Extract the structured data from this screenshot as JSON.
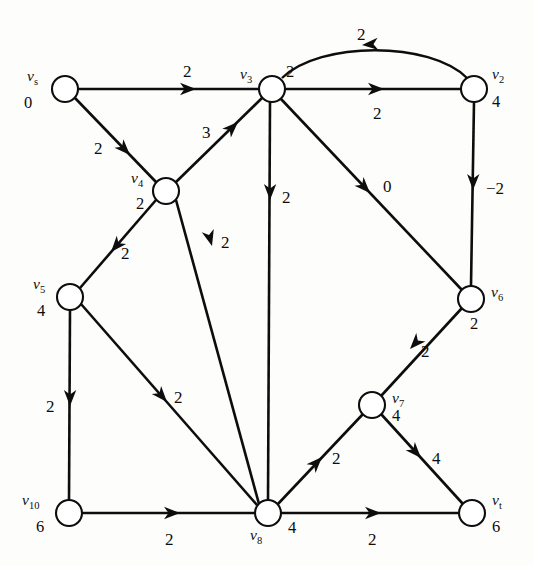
{
  "figure": {
    "kind": "directed-graph-diagram",
    "colors": {
      "ink": "#0d0d0d",
      "node_fill": "#ffffff",
      "background": "#fdfdfc"
    }
  },
  "nodes": [
    {
      "id": "vs",
      "name": "v",
      "sub": "s",
      "value": "0",
      "cx": 65,
      "cy": 89,
      "r": 13,
      "name_x": 27,
      "name_y": 68,
      "value_x": 24,
      "value_y": 95
    },
    {
      "id": "v3",
      "name": "v",
      "sub": "3",
      "value": "2",
      "cx": 272,
      "cy": 89,
      "r": 13,
      "name_x": 240,
      "name_y": 66,
      "value_x": 286,
      "value_y": 64
    },
    {
      "id": "v2",
      "name": "v",
      "sub": "2",
      "value": "4",
      "cx": 474,
      "cy": 89,
      "r": 13,
      "name_x": 492,
      "name_y": 66,
      "value_x": 492,
      "value_y": 94
    },
    {
      "id": "v4",
      "name": "v",
      "sub": "4",
      "value": "2",
      "cx": 166,
      "cy": 191,
      "r": 13,
      "name_x": 131,
      "name_y": 170,
      "value_x": 136,
      "value_y": 196
    },
    {
      "id": "v5",
      "name": "v",
      "sub": "5",
      "value": "4",
      "cx": 70,
      "cy": 297,
      "r": 13,
      "name_x": 33,
      "name_y": 276,
      "value_x": 37,
      "value_y": 303
    },
    {
      "id": "v6",
      "name": "v",
      "sub": "6",
      "value": "2",
      "cx": 471,
      "cy": 299,
      "r": 13,
      "name_x": 491,
      "name_y": 284,
      "value_x": 470,
      "value_y": 316
    },
    {
      "id": "v7",
      "name": "v",
      "sub": "7",
      "value": "4",
      "cx": 372,
      "cy": 405,
      "r": 13,
      "name_x": 392,
      "name_y": 390,
      "value_x": 392,
      "value_y": 408
    },
    {
      "id": "v8",
      "name": "v",
      "sub": "8",
      "value": "4",
      "cx": 268,
      "cy": 513,
      "r": 13,
      "name_x": 250,
      "name_y": 527,
      "value_x": 288,
      "value_y": 520
    },
    {
      "id": "v10",
      "name": "v",
      "sub": "10",
      "value": "6",
      "cx": 69,
      "cy": 513,
      "r": 13,
      "name_x": 22,
      "name_y": 492,
      "value_x": 36,
      "value_y": 519
    },
    {
      "id": "vt",
      "name": "v",
      "sub": "t",
      "value": "6",
      "cx": 472,
      "cy": 513,
      "r": 13,
      "name_x": 492,
      "name_y": 492,
      "value_x": 492,
      "value_y": 519
    }
  ],
  "edges": [
    {
      "id": "vs-v3",
      "from": "vs",
      "to": "v3",
      "weight": "2",
      "shape": "line",
      "x1": 78,
      "y1": 89,
      "x2": 259,
      "y2": 89,
      "ax": 196,
      "ay": 89,
      "lx": 183,
      "ly": 63
    },
    {
      "id": "vs-v4",
      "from": "vs",
      "to": "v4",
      "weight": "2",
      "shape": "line",
      "x1": 75,
      "y1": 98,
      "x2": 156,
      "y2": 182,
      "ax": 130,
      "ay": 155,
      "lx": 94,
      "ly": 140
    },
    {
      "id": "v4-v3",
      "from": "v4",
      "to": "v3",
      "weight": "3",
      "shape": "line",
      "x1": 176,
      "y1": 182,
      "x2": 262,
      "y2": 98,
      "ax": 238,
      "ay": 122,
      "lx": 202,
      "ly": 124
    },
    {
      "id": "v3-v2",
      "from": "v3",
      "to": "v2",
      "weight": "2",
      "shape": "line",
      "x1": 285,
      "y1": 89,
      "x2": 461,
      "y2": 89,
      "ax": 384,
      "ay": 89,
      "lx": 373,
      "ly": 105
    },
    {
      "id": "v2-v3",
      "from": "v2",
      "to": "v3",
      "weight": "2",
      "shape": "curve",
      "path": "M 467 78 C 430 41, 320 41, 282 78",
      "ax": 362,
      "ay": 45,
      "lx": 357,
      "ly": 26
    },
    {
      "id": "v3-v8",
      "from": "v3",
      "to": "v8",
      "weight": "2",
      "shape": "line",
      "x1": 270,
      "y1": 102,
      "x2": 268,
      "y2": 500,
      "ax": 270,
      "ay": 200,
      "lx": 282,
      "ly": 189
    },
    {
      "id": "v3-v6",
      "from": "v3",
      "to": "v6",
      "weight": "0",
      "shape": "line",
      "x1": 281,
      "y1": 99,
      "x2": 462,
      "y2": 290,
      "ax": 370,
      "ay": 193,
      "lx": 383,
      "ly": 178
    },
    {
      "id": "v2-v6",
      "from": "v2",
      "to": "v6",
      "weight": "−2",
      "shape": "line",
      "x1": 474,
      "y1": 102,
      "x2": 471,
      "y2": 286,
      "ax": 473,
      "ay": 190,
      "lx": 486,
      "ly": 180
    },
    {
      "id": "v4-v5",
      "from": "v4",
      "to": "v5",
      "weight": "2",
      "shape": "line",
      "x1": 156,
      "y1": 200,
      "x2": 80,
      "y2": 288,
      "ax": 111,
      "ay": 252,
      "lx": 121,
      "ly": 245
    },
    {
      "id": "v4-v8",
      "from": "v4",
      "to": "v8",
      "weight": "2",
      "shape": "line",
      "x1": 176,
      "y1": 200,
      "x2": 259,
      "y2": 504,
      "ax": 212,
      "ay": 246,
      "lx": 221,
      "ly": 234
    },
    {
      "id": "v5-v10",
      "from": "v5",
      "to": "v10",
      "weight": "2",
      "shape": "line",
      "x1": 70,
      "y1": 310,
      "x2": 69,
      "y2": 500,
      "ax": 70,
      "ay": 406,
      "lx": 46,
      "ly": 398
    },
    {
      "id": "v5-v8",
      "from": "v5",
      "to": "v8",
      "weight": "2",
      "shape": "line",
      "x1": 81,
      "y1": 304,
      "x2": 257,
      "y2": 505,
      "ax": 167,
      "ay": 402,
      "lx": 174,
      "ly": 389
    },
    {
      "id": "v10-v8",
      "from": "v10",
      "to": "v8",
      "weight": "2",
      "shape": "line",
      "x1": 82,
      "y1": 513,
      "x2": 255,
      "y2": 513,
      "ax": 180,
      "ay": 513,
      "lx": 165,
      "ly": 531
    },
    {
      "id": "v8-v7",
      "from": "v8",
      "to": "v7",
      "weight": "2",
      "shape": "line",
      "x1": 277,
      "y1": 505,
      "x2": 363,
      "y2": 414,
      "ax": 322,
      "ay": 457,
      "lx": 332,
      "ly": 450
    },
    {
      "id": "v6-v7",
      "from": "v6",
      "to": "v7",
      "weight": "2",
      "shape": "line",
      "x1": 462,
      "y1": 308,
      "x2": 381,
      "y2": 396,
      "ax": 410,
      "ay": 349,
      "lx": 421,
      "ly": 343
    },
    {
      "id": "v7-vt",
      "from": "v7",
      "to": "vt",
      "weight": "4",
      "shape": "line",
      "x1": 381,
      "y1": 414,
      "x2": 463,
      "y2": 504,
      "ax": 421,
      "ay": 458,
      "lx": 432,
      "ly": 450
    },
    {
      "id": "v8-vt",
      "from": "v8",
      "to": "vt",
      "weight": "2",
      "shape": "line",
      "x1": 281,
      "y1": 513,
      "x2": 459,
      "y2": 513,
      "ax": 381,
      "ay": 513,
      "lx": 368,
      "ly": 531
    }
  ]
}
